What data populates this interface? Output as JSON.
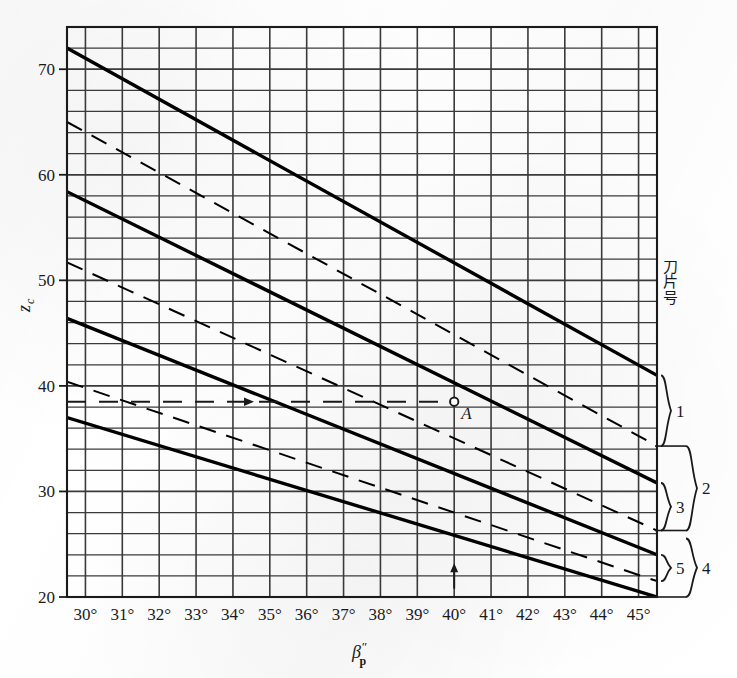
{
  "chart_data": {
    "type": "line",
    "title": "",
    "xlabel": "β″ₚ",
    "ylabel": "zᴄ",
    "xlabel_base": "β",
    "xlabel_sup": "″",
    "xlabel_sub": "p",
    "ylabel_base": "z",
    "ylabel_sub": "c",
    "xlim": [
      29.5,
      45.5
    ],
    "ylim": [
      20,
      74
    ],
    "grid": true,
    "x_major_step": 1,
    "y_major_step": 2,
    "legend_position": "right-outside",
    "x_tick_labels": [
      "30°",
      "31°",
      "32°",
      "33°",
      "34°",
      "35°",
      "36°",
      "37°",
      "38°",
      "39°",
      "40°",
      "41°",
      "42°",
      "43°",
      "44°",
      "45°"
    ],
    "x_tick_values": [
      30,
      31,
      32,
      33,
      34,
      35,
      36,
      37,
      38,
      39,
      40,
      41,
      42,
      43,
      44,
      45
    ],
    "y_tick_labels": [
      "20",
      "30",
      "40",
      "50",
      "60",
      "70"
    ],
    "y_tick_values": [
      20,
      30,
      40,
      50,
      60,
      70
    ],
    "series": [
      {
        "name": "1-solid",
        "style": "solid",
        "blade_group": "1",
        "x": [
          29.5,
          45.5
        ],
        "y": [
          72.0,
          41.0
        ]
      },
      {
        "name": "1-dashed",
        "style": "dashed",
        "blade_group": "1",
        "x": [
          29.5,
          45.5
        ],
        "y": [
          65.0,
          34.3
        ]
      },
      {
        "name": "2-solid",
        "style": "solid",
        "blade_group": "2",
        "x": [
          29.5,
          45.5
        ],
        "y": [
          58.4,
          30.8
        ]
      },
      {
        "name": "2-dashed",
        "style": "dashed",
        "blade_group": "3",
        "x": [
          29.5,
          45.5
        ],
        "y": [
          51.7,
          26.3
        ]
      },
      {
        "name": "3-solid",
        "style": "solid",
        "blade_group": "4",
        "x": [
          29.5,
          45.5
        ],
        "y": [
          46.4,
          24.0
        ]
      },
      {
        "name": "3-dashed",
        "style": "dashed",
        "blade_group": "5",
        "x": [
          29.5,
          45.5
        ],
        "y": [
          40.4,
          21.5
        ]
      },
      {
        "name": "4-solid",
        "style": "solid",
        "blade_group": "5",
        "x": [
          29.5,
          45.5
        ],
        "y": [
          37.0,
          20.0
        ]
      }
    ],
    "annotations": [
      {
        "name": "point-A",
        "label": "A",
        "x": 40,
        "y": 38.5,
        "marker": "open-circle"
      },
      {
        "name": "construction-line-horizontal",
        "label": "",
        "style": "dashed-with-arrow",
        "from_x": 29.5,
        "to_x": 40,
        "y": 38.5
      },
      {
        "name": "construction-arrow-vertical",
        "label": "",
        "style": "arrow-up",
        "x": 40,
        "from_y": 20.8,
        "to_y": 23.2
      }
    ]
  },
  "legend": {
    "title_chars": [
      "刀",
      "片",
      "号"
    ],
    "title_text": "刀片号",
    "items": [
      {
        "label": "1"
      },
      {
        "label": "2"
      },
      {
        "label": "3"
      },
      {
        "label": "4"
      },
      {
        "label": "5"
      }
    ]
  },
  "colors": {
    "ink": "#1a1a1a",
    "grid": "#3a3a3a",
    "paper": "#ffffff",
    "curve": "#000000"
  }
}
